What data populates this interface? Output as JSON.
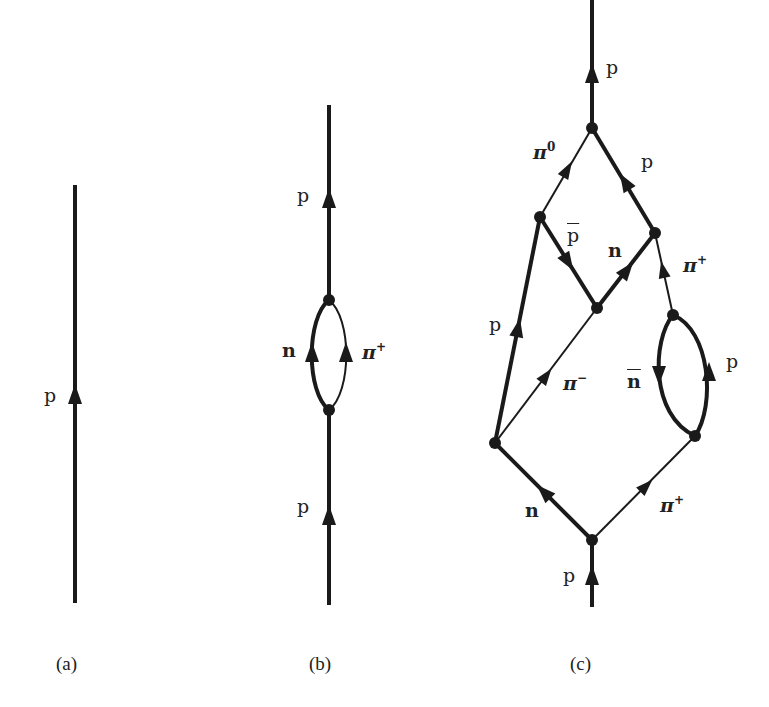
{
  "figure": {
    "panels": [
      {
        "id": "a",
        "caption": "(a)",
        "description": "bare proton propagator",
        "labels": [
          {
            "text": "p",
            "particle": "proton"
          }
        ]
      },
      {
        "id": "b",
        "caption": "(b)",
        "description": "proton with one n + pi+ loop",
        "labels": [
          {
            "text": "p",
            "particle": "proton",
            "position": "upper"
          },
          {
            "text": "n",
            "particle": "neutron"
          },
          {
            "text": "π",
            "sup": "+",
            "particle": "pi-plus"
          },
          {
            "text": "p",
            "particle": "proton",
            "position": "lower"
          }
        ]
      },
      {
        "id": "c",
        "caption": "(c)",
        "description": "higher-order proton self-energy diagram",
        "labels": [
          {
            "text": "p",
            "particle": "proton",
            "position": "top-out"
          },
          {
            "text": "π",
            "sup": "0",
            "particle": "pi-zero"
          },
          {
            "text": "p",
            "particle": "proton",
            "position": "upper-right"
          },
          {
            "text": "p",
            "overbar": true,
            "particle": "antiproton"
          },
          {
            "text": "n",
            "particle": "neutron",
            "position": "middle"
          },
          {
            "text": "π",
            "sup": "+",
            "particle": "pi-plus",
            "position": "right"
          },
          {
            "text": "p",
            "particle": "proton",
            "position": "left"
          },
          {
            "text": "π",
            "sup": "−",
            "particle": "pi-minus"
          },
          {
            "text": "n",
            "overbar": true,
            "particle": "antineutron"
          },
          {
            "text": "p",
            "particle": "proton",
            "position": "loop-right"
          },
          {
            "text": "n",
            "particle": "neutron",
            "position": "lower-left"
          },
          {
            "text": "π",
            "sup": "+",
            "particle": "pi-plus",
            "position": "lower-right"
          },
          {
            "text": "p",
            "particle": "proton",
            "position": "bottom-in"
          }
        ]
      }
    ],
    "colors": {
      "line": "#1a1a1a",
      "background": "#ffffff",
      "text": "#222222"
    }
  }
}
